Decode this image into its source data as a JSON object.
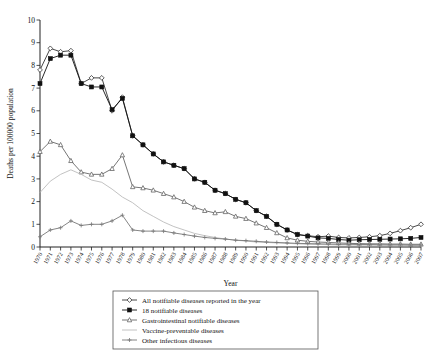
{
  "figure": {
    "background": "#ffffff",
    "axis_color": "#222222"
  },
  "chart_data": {
    "type": "line",
    "title": "",
    "xlabel": "Year",
    "ylabel": "Deaths per 100000 population",
    "xlim": [
      1970,
      2007
    ],
    "ylim": [
      0,
      10
    ],
    "yticks": [
      0,
      1,
      2,
      3,
      4,
      5,
      6,
      7,
      8,
      9,
      10
    ],
    "grid": false,
    "legend_position": "bottom-center",
    "categories": [
      1970,
      1971,
      1972,
      1973,
      1974,
      1975,
      1976,
      1977,
      1978,
      1979,
      1980,
      1981,
      1982,
      1983,
      1984,
      1985,
      1986,
      1987,
      1988,
      1989,
      1990,
      1991,
      1992,
      1993,
      1994,
      1995,
      1996,
      1997,
      1998,
      1999,
      2000,
      2001,
      2002,
      2003,
      2004,
      2005,
      2006,
      2007
    ],
    "tick_labels": [
      "1970",
      "1971",
      "1972",
      "1973",
      "1974",
      "1975",
      "1976",
      "1977",
      "1978",
      "1979",
      "1980",
      "1981",
      "1982",
      "1983",
      "1984",
      "1985",
      "1986",
      "1987",
      "1988",
      "1989",
      "1990",
      "1991",
      "1992",
      "1993",
      "1994",
      "1995",
      "1996",
      "1997",
      "1998",
      "1999",
      "2000",
      "2001",
      "2002",
      "2003",
      "2004",
      "2005",
      "2006",
      "2007"
    ],
    "series": [
      {
        "name": "All notifiable diseases reported in the year",
        "color": "#333333",
        "marker": "diamond",
        "values": [
          7.8,
          8.75,
          8.6,
          8.65,
          7.2,
          7.45,
          7.45,
          6.0,
          6.6,
          4.9,
          4.5,
          4.1,
          3.75,
          3.6,
          3.45,
          3.0,
          2.85,
          2.5,
          2.35,
          2.1,
          1.95,
          1.6,
          1.35,
          1.0,
          0.75,
          0.55,
          0.5,
          0.45,
          0.48,
          0.42,
          0.4,
          0.42,
          0.45,
          0.5,
          0.6,
          0.72,
          0.85,
          1.0
        ]
      },
      {
        "name": "18 notifiable diseases",
        "color": "#111111",
        "marker": "square",
        "values": [
          7.2,
          8.3,
          8.45,
          8.45,
          7.2,
          7.05,
          7.05,
          6.05,
          6.55,
          4.9,
          4.5,
          4.1,
          3.75,
          3.6,
          3.45,
          3.0,
          2.85,
          2.5,
          2.35,
          2.1,
          1.95,
          1.6,
          1.35,
          1.0,
          0.75,
          0.55,
          0.48,
          0.4,
          0.38,
          0.33,
          0.3,
          0.32,
          0.33,
          0.34,
          0.35,
          0.36,
          0.38,
          0.42
        ]
      },
      {
        "name": "Gastrointestinal notifiable diseases",
        "color": "#666666",
        "marker": "triangle",
        "values": [
          4.2,
          4.65,
          4.5,
          3.8,
          3.3,
          3.2,
          3.2,
          3.45,
          4.05,
          2.65,
          2.6,
          2.5,
          2.35,
          2.2,
          2.0,
          1.75,
          1.6,
          1.5,
          1.55,
          1.35,
          1.25,
          1.05,
          0.85,
          0.62,
          0.4,
          0.3,
          0.25,
          0.22,
          0.2,
          0.18,
          0.16,
          0.15,
          0.14,
          0.14,
          0.13,
          0.13,
          0.12,
          0.12
        ]
      },
      {
        "name": "Vaccine-preventable diseases",
        "color": "#bbbbbb",
        "marker": "none",
        "values": [
          2.4,
          2.9,
          3.2,
          3.4,
          3.2,
          2.95,
          2.85,
          2.55,
          2.2,
          1.95,
          1.6,
          1.35,
          1.1,
          0.9,
          0.75,
          0.6,
          0.5,
          0.42,
          0.35,
          0.3,
          0.26,
          0.22,
          0.2,
          0.18,
          0.16,
          0.14,
          0.12,
          0.11,
          0.1,
          0.09,
          0.09,
          0.08,
          0.08,
          0.08,
          0.07,
          0.07,
          0.07,
          0.06
        ]
      },
      {
        "name": "Other infectious diseases",
        "color": "#777777",
        "marker": "cross",
        "values": [
          0.45,
          0.75,
          0.85,
          1.15,
          0.95,
          1.0,
          1.0,
          1.15,
          1.4,
          0.75,
          0.7,
          0.7,
          0.7,
          0.62,
          0.55,
          0.48,
          0.42,
          0.38,
          0.35,
          0.3,
          0.28,
          0.25,
          0.22,
          0.2,
          0.18,
          0.16,
          0.15,
          0.14,
          0.13,
          0.12,
          0.12,
          0.11,
          0.11,
          0.1,
          0.1,
          0.1,
          0.09,
          0.09
        ]
      }
    ]
  }
}
